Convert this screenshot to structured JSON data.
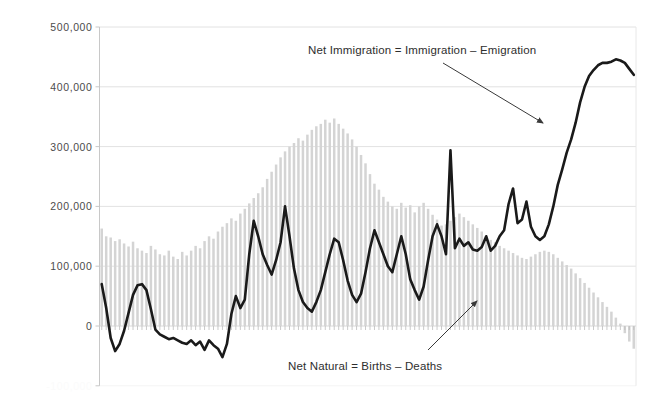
{
  "chart_data": {
    "type": "bar",
    "title": "",
    "subtitle": "",
    "xlabel": "",
    "ylabel": "",
    "ylim": [
      -100000,
      500000
    ],
    "grid": true,
    "legend_position": "none",
    "y_ticks": [
      {
        "value": 500000,
        "label": "500,000"
      },
      {
        "value": 400000,
        "label": "400,000"
      },
      {
        "value": 300000,
        "label": "300,000"
      },
      {
        "value": 200000,
        "label": "200,000"
      },
      {
        "value": 100000,
        "label": "100,000"
      },
      {
        "value": 0,
        "label": "0"
      },
      {
        "value": -100000,
        "label": "-100,000"
      }
    ],
    "x": [
      1,
      2,
      3,
      4,
      5,
      6,
      7,
      8,
      9,
      10,
      11,
      12,
      13,
      14,
      15,
      16,
      17,
      18,
      19,
      20,
      21,
      22,
      23,
      24,
      25,
      26,
      27,
      28,
      29,
      30,
      31,
      32,
      33,
      34,
      35,
      36,
      37,
      38,
      39,
      40,
      41,
      42,
      43,
      44,
      45,
      46,
      47,
      48,
      49,
      50,
      51,
      52,
      53,
      54,
      55,
      56,
      57,
      58,
      59,
      60,
      61,
      62,
      63,
      64,
      65,
      66,
      67,
      68,
      69,
      70,
      71,
      72,
      73,
      74,
      75,
      76,
      77,
      78,
      79,
      80,
      81,
      82,
      83,
      84,
      85,
      86,
      87,
      88,
      89,
      90,
      91,
      92,
      93,
      94,
      95,
      96,
      97,
      98,
      99,
      100,
      101,
      102,
      103,
      104,
      105,
      106,
      107,
      108,
      109,
      110,
      111,
      112,
      113,
      114,
      115,
      116,
      117,
      118,
      119,
      120
    ],
    "series": [
      {
        "name": "Net Natural = Births – Deaths",
        "type": "bar",
        "color": "#d4d4d4",
        "values": [
          163000,
          150000,
          148000,
          142000,
          145000,
          138000,
          133000,
          141000,
          130000,
          126000,
          122000,
          134000,
          128000,
          120000,
          118000,
          126000,
          116000,
          112000,
          124000,
          118000,
          126000,
          134000,
          130000,
          142000,
          150000,
          146000,
          158000,
          166000,
          172000,
          180000,
          176000,
          188000,
          196000,
          205000,
          214000,
          222000,
          232000,
          246000,
          258000,
          270000,
          282000,
          292000,
          300000,
          306000,
          314000,
          310000,
          320000,
          328000,
          334000,
          338000,
          345000,
          340000,
          347000,
          338000,
          330000,
          322000,
          312000,
          300000,
          286000,
          272000,
          254000,
          238000,
          228000,
          216000,
          208000,
          200000,
          196000,
          206000,
          198000,
          202000,
          190000,
          200000,
          206000,
          196000,
          186000,
          178000,
          168000,
          170000,
          176000,
          182000,
          188000,
          182000,
          176000,
          170000,
          164000,
          158000,
          150000,
          144000,
          140000,
          134000,
          130000,
          126000,
          122000,
          118000,
          114000,
          112000,
          116000,
          120000,
          124000,
          126000,
          124000,
          120000,
          114000,
          108000,
          102000,
          96000,
          88000,
          80000,
          72000,
          64000,
          56000,
          48000,
          40000,
          32000,
          24000,
          14000,
          4000,
          -12000,
          -26000,
          -38000
        ]
      },
      {
        "name": "Net Immigration = Immigration – Emigration",
        "type": "line",
        "color": "#1a1a1a",
        "values": [
          70000,
          30000,
          -20000,
          -42000,
          -30000,
          -8000,
          22000,
          52000,
          68000,
          70000,
          60000,
          28000,
          -6000,
          -14000,
          -18000,
          -22000,
          -20000,
          -24000,
          -28000,
          -30000,
          -24000,
          -32000,
          -26000,
          -40000,
          -24000,
          -32000,
          -38000,
          -52000,
          -30000,
          20000,
          50000,
          30000,
          44000,
          120000,
          176000,
          150000,
          120000,
          102000,
          86000,
          110000,
          140000,
          200000,
          150000,
          96000,
          60000,
          40000,
          30000,
          24000,
          40000,
          60000,
          90000,
          120000,
          146000,
          140000,
          110000,
          76000,
          52000,
          40000,
          54000,
          90000,
          130000,
          160000,
          140000,
          120000,
          100000,
          90000,
          120000,
          150000,
          120000,
          78000,
          60000,
          44000,
          66000,
          110000,
          150000,
          170000,
          150000,
          120000,
          294000,
          130000,
          146000,
          134000,
          140000,
          128000,
          126000,
          132000,
          150000,
          126000,
          134000,
          150000,
          160000,
          204000,
          230000,
          172000,
          178000,
          208000,
          166000,
          150000,
          144000,
          150000,
          170000,
          200000,
          236000,
          262000,
          290000,
          312000,
          340000,
          374000,
          400000,
          418000,
          428000,
          436000,
          440000,
          440000,
          442000,
          446000,
          444000,
          440000,
          430000,
          420000
        ]
      }
    ],
    "annotations": [
      {
        "id": "immigration-annotation",
        "text": "Net Immigration = Immigration – Emigration",
        "x_px": 308,
        "y_px": 44,
        "arrow": {
          "x1": 443,
          "y1": 63,
          "x2": 543,
          "y2": 123
        }
      },
      {
        "id": "natural-annotation",
        "text": "Net Natural = Births – Deaths",
        "x_px": 288,
        "y_px": 360,
        "arrow": {
          "x1": 428,
          "y1": 350,
          "x2": 477,
          "y2": 301
        }
      }
    ],
    "colors": {
      "bar": "#d4d4d4",
      "line": "#1a1a1a",
      "grid": "#e2e2e2",
      "axis": "#c8c8c8",
      "text": "#4c4c4c",
      "annotation_text": "#2e2e2e",
      "background": "#ffffff"
    }
  }
}
